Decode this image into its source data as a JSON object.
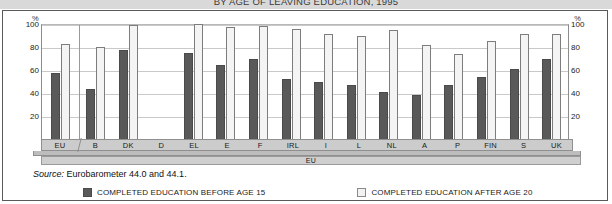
{
  "title": "BY AGE OF LEAVING EDUCATION, 1995",
  "axis": {
    "unit_left": "%",
    "unit_right": "%",
    "ticks": [
      "100",
      "80",
      "60",
      "40",
      "20"
    ]
  },
  "band_label": "EU",
  "source": {
    "prefix": "Source:",
    "text": "Eurobarometer 44.0 and 44.1."
  },
  "legend": {
    "before_label": "COMPLETED EDUCATION BEFORE AGE 15",
    "after_label": "COMPLETED EDUCATION AFTER AGE 20",
    "before_color": "#595959",
    "after_color": "#f2f2f2"
  },
  "chart_data": {
    "type": "bar",
    "title": "BY AGE OF LEAVING EDUCATION, 1995",
    "xlabel": "EU",
    "ylabel": "%",
    "ylim": [
      0,
      100
    ],
    "yticks": [
      20,
      40,
      60,
      80,
      100
    ],
    "grid": true,
    "legend_position": "bottom",
    "categories": [
      "EU",
      "B",
      "DK",
      "D",
      "EL",
      "E",
      "F",
      "IRL",
      "I",
      "L",
      "NL",
      "A",
      "P",
      "FIN",
      "S",
      "UK"
    ],
    "series": [
      {
        "name": "COMPLETED EDUCATION BEFORE AGE 15",
        "color": "#595959",
        "values": [
          58,
          44,
          78,
          null,
          75,
          65,
          70,
          53,
          50,
          47,
          41,
          39,
          47,
          54,
          61,
          70
        ]
      },
      {
        "name": "COMPLETED EDUCATION AFTER AGE 20",
        "color": "#f2f2f2",
        "values": [
          83,
          80,
          99,
          null,
          100,
          97,
          98,
          96,
          91,
          90,
          95,
          82,
          74,
          85,
          91,
          91
        ]
      }
    ]
  }
}
